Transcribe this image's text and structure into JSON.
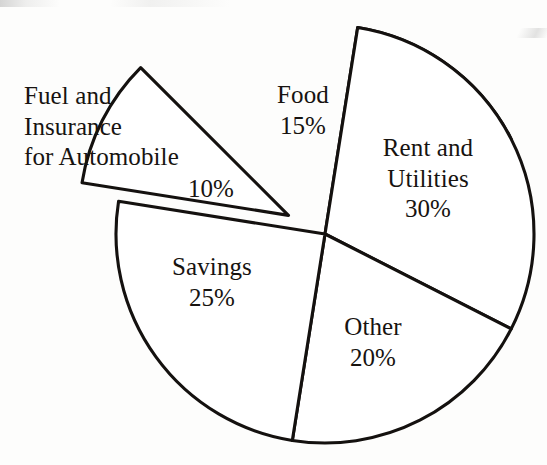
{
  "chart_data": {
    "type": "pie",
    "title": "",
    "categories": [
      "Food",
      "Rent and Utilities",
      "Other",
      "Savings",
      "Fuel and Insurance for Automobile"
    ],
    "values": [
      15,
      30,
      20,
      25,
      10
    ],
    "unit": "%",
    "legend": "none",
    "labels_position": "inside-and-outside",
    "exploded_slices": [
      "Fuel and Insurance for Automobile"
    ],
    "start_angle_deg": -81,
    "direction": "clockwise",
    "slices": [
      {
        "name": "Food",
        "label": "Food",
        "value": 15,
        "value_text": "15%",
        "label_placement": "inside",
        "exploded": false,
        "start_angle_deg": -81,
        "end_angle_deg": -27,
        "fill": "#ffffff",
        "stroke": "#14110f"
      },
      {
        "name": "Rent and Utilities",
        "label": "Rent and\nUtilities",
        "value": 30,
        "value_text": "30%",
        "label_placement": "inside",
        "exploded": false,
        "start_angle_deg": -81,
        "end_angle_deg": 27,
        "fill": "#ffffff",
        "stroke": "#14110f"
      },
      {
        "name": "Other",
        "label": "Other",
        "value": 20,
        "value_text": "20%",
        "label_placement": "inside",
        "exploded": false,
        "start_angle_deg": 27,
        "end_angle_deg": 99,
        "fill": "#ffffff",
        "stroke": "#14110f"
      },
      {
        "name": "Savings",
        "label": "Savings",
        "value": 25,
        "value_text": "25%",
        "label_placement": "inside",
        "exploded": false,
        "start_angle_deg": 99,
        "end_angle_deg": 189,
        "fill": "#ffffff",
        "stroke": "#14110f"
      },
      {
        "name": "Fuel and Insurance for Automobile",
        "label": "Fuel and\nInsurance\nfor Automobile",
        "value": 10,
        "value_text": "10%",
        "label_placement": "outside",
        "exploded": true,
        "start_angle_deg": 189,
        "end_angle_deg": 225,
        "fill": "#ffffff",
        "stroke": "#14110f"
      }
    ]
  },
  "labels": {
    "food": "Food\n15%",
    "rent": "Rent and\nUtilities\n30%",
    "other": "Other\n20%",
    "savings": "Savings\n25%",
    "fuel": "Fuel and\nInsurance\nfor Automobile",
    "fuel_pct": "10%"
  },
  "style": {
    "background": "#fdfdfc",
    "line_color": "#14110f",
    "text_color": "#171310",
    "slice_fill": "#ffffff"
  }
}
